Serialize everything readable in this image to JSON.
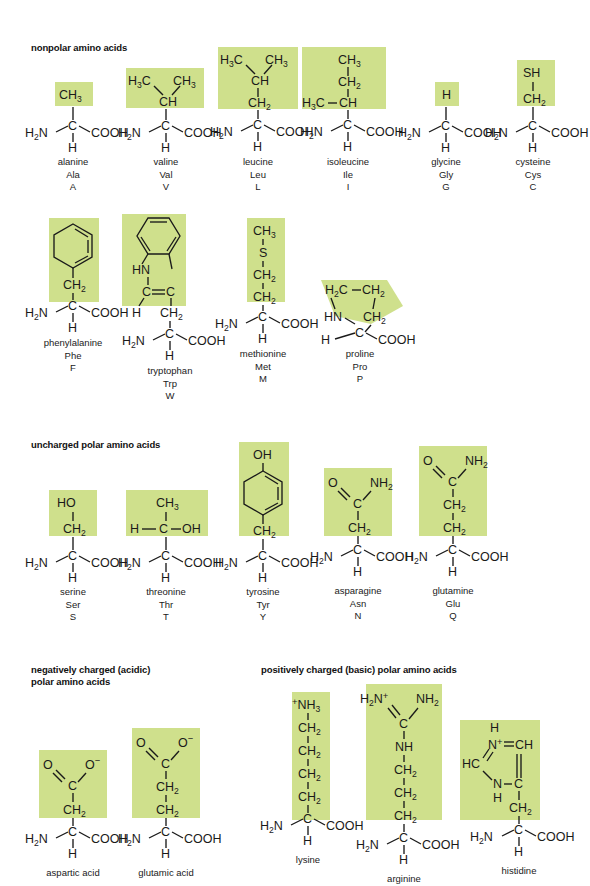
{
  "figure": {
    "highlight_color": "#cfe08c",
    "background_color": "#ffffff"
  },
  "sections": [
    {
      "id": "nonpolar",
      "heading": "nonpolar amino acids"
    },
    {
      "id": "uncharged_polar",
      "heading": "uncharged polar amino acids"
    },
    {
      "id": "acidic",
      "heading": "negatively charged (acidic)\npolar amino acids"
    },
    {
      "id": "basic",
      "heading": "positively charged (basic) polar amino acids"
    }
  ],
  "backbone": {
    "amine": "H",
    "amine_sub": "2",
    "amine_n": "N",
    "alpha_carbon": "C",
    "alpha_hydrogen": "H",
    "carboxyl": "COOH"
  },
  "amino_acids": [
    {
      "id": "alanine",
      "name": "alanine",
      "three": "Ala",
      "one": "A",
      "section": "nonpolar",
      "side_chain": [
        "CH3"
      ]
    },
    {
      "id": "valine",
      "name": "valine",
      "three": "Val",
      "one": "V",
      "section": "nonpolar",
      "side_chain": [
        "H3C",
        "CH3",
        "CH"
      ]
    },
    {
      "id": "leucine",
      "name": "leucine",
      "three": "Leu",
      "one": "L",
      "section": "nonpolar",
      "side_chain": [
        "H3C",
        "CH3",
        "CH",
        "CH2"
      ]
    },
    {
      "id": "isoleucine",
      "name": "isoleucine",
      "three": "Ile",
      "one": "I",
      "section": "nonpolar",
      "side_chain": [
        "CH3",
        "CH2",
        "H3C",
        "CH"
      ]
    },
    {
      "id": "glycine",
      "name": "glycine",
      "three": "Gly",
      "one": "G",
      "section": "nonpolar",
      "side_chain": [
        "H"
      ]
    },
    {
      "id": "cysteine",
      "name": "cysteine",
      "three": "Cys",
      "one": "C",
      "section": "nonpolar",
      "side_chain": [
        "SH",
        "CH2"
      ]
    },
    {
      "id": "phenylalanine",
      "name": "phenylalanine",
      "three": "Phe",
      "one": "F",
      "section": "nonpolar",
      "side_chain": [
        "benzene ring",
        "CH2"
      ]
    },
    {
      "id": "tryptophan",
      "name": "tryptophan",
      "three": "Trp",
      "one": "W",
      "section": "nonpolar",
      "side_chain": [
        "indole ring",
        "HN",
        "C=C",
        "H",
        "CH2"
      ]
    },
    {
      "id": "methionine",
      "name": "methionine",
      "three": "Met",
      "one": "M",
      "section": "nonpolar",
      "side_chain": [
        "CH3",
        "S",
        "CH2",
        "CH2"
      ]
    },
    {
      "id": "proline",
      "name": "proline",
      "three": "Pro",
      "one": "P",
      "section": "nonpolar",
      "side_chain": [
        "H2C",
        "CH2",
        "CH2",
        "HN"
      ]
    },
    {
      "id": "serine",
      "name": "serine",
      "three": "Ser",
      "one": "S",
      "section": "uncharged_polar",
      "side_chain": [
        "HO",
        "CH2"
      ]
    },
    {
      "id": "threonine",
      "name": "threonine",
      "three": "Thr",
      "one": "T",
      "section": "uncharged_polar",
      "side_chain": [
        "CH3",
        "H",
        "C",
        "OH"
      ]
    },
    {
      "id": "tyrosine",
      "name": "tyrosine",
      "three": "Tyr",
      "one": "Y",
      "section": "uncharged_polar",
      "side_chain": [
        "OH",
        "benzene ring",
        "CH2"
      ]
    },
    {
      "id": "asparagine",
      "name": "asparagine",
      "three": "Asn",
      "one": "N",
      "section": "uncharged_polar",
      "side_chain": [
        "O",
        "C",
        "NH2",
        "CH2"
      ]
    },
    {
      "id": "glutamine",
      "name": "glutamine",
      "three": "Glu",
      "one": "Q",
      "section": "uncharged_polar",
      "side_chain": [
        "O",
        "C",
        "NH2",
        "CH2",
        "CH2"
      ]
    },
    {
      "id": "aspartic_acid",
      "name": "aspartic acid",
      "three": "",
      "one": "",
      "section": "acidic",
      "side_chain": [
        "O",
        "C",
        "O-",
        "CH2"
      ]
    },
    {
      "id": "glutamic_acid",
      "name": "glutamic acid",
      "three": "",
      "one": "",
      "section": "acidic",
      "side_chain": [
        "O",
        "C",
        "O-",
        "CH2",
        "CH2"
      ]
    },
    {
      "id": "lysine",
      "name": "lysine",
      "three": "",
      "one": "",
      "section": "basic",
      "side_chain": [
        "+NH3",
        "CH2",
        "CH2",
        "CH2",
        "CH2"
      ]
    },
    {
      "id": "arginine",
      "name": "arginine",
      "three": "",
      "one": "",
      "section": "basic",
      "side_chain": [
        "H2N+",
        "C",
        "NH2",
        "NH",
        "CH2",
        "CH2",
        "CH2"
      ]
    },
    {
      "id": "histidine",
      "name": "histidine",
      "three": "",
      "one": "",
      "section": "basic",
      "side_chain": [
        "imidazolium ring",
        "H",
        "N+",
        "CH",
        "HC",
        "N",
        "H",
        "C",
        "CH2"
      ]
    }
  ],
  "labels": {
    "ch3": "CH",
    "ch2": "CH",
    "ch": "CH",
    "h3c": "H",
    "c": "C",
    "h": "H",
    "sh": "SH",
    "s": "S",
    "ho": "HO",
    "oh": "OH",
    "o": "O",
    "n": "N",
    "nh": "NH",
    "hn": "HN",
    "hc": "HC",
    "cooh": "COOH",
    "sub2": "2",
    "sub3": "3",
    "plus": "+",
    "minus": "−"
  }
}
